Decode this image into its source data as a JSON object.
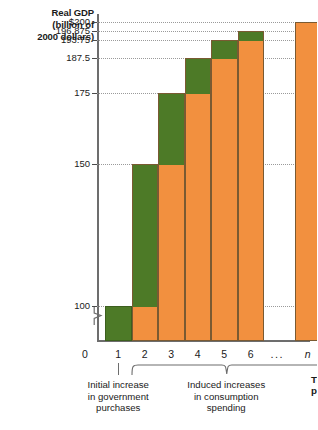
{
  "chart_data": {
    "type": "bar",
    "title": "",
    "ylabel": "Real GDP (billion of 2000 dollars)",
    "ylabel_lines": [
      "Real GDP",
      "(billion of",
      "2000 dollars)"
    ],
    "xlabel": "Time period",
    "xlabel_lines": [
      "Time",
      "period"
    ],
    "grid": true,
    "legend": "none",
    "axis_break": true,
    "ylim": [
      87.5,
      203
    ],
    "categories": [
      "1",
      "2",
      "3",
      "4",
      "5",
      "6",
      "...",
      "n"
    ],
    "yticks": [
      {
        "value": 200,
        "label": "$200"
      },
      {
        "value": 196.875,
        "label": "196.875"
      },
      {
        "value": 193.75,
        "label": "193.75"
      },
      {
        "value": 187.5,
        "label": "187.5"
      },
      {
        "value": 175,
        "label": "175"
      },
      {
        "value": 150,
        "label": "150"
      },
      {
        "value": 100,
        "label": "100"
      }
    ],
    "xtick_zero_label": "0",
    "series": [
      {
        "name": "Prior level (cumulative real GDP)",
        "color": "#f2903f",
        "values": [
          0,
          100,
          150,
          175,
          187.5,
          193.75,
          null,
          200
        ]
      },
      {
        "name": "New increase in real GDP",
        "color": "#4d7a27",
        "values": [
          100,
          50,
          25,
          12.5,
          6.25,
          3.125,
          null,
          0
        ]
      }
    ],
    "totals": [
      100,
      150,
      175,
      187.5,
      193.75,
      196.875,
      null,
      200
    ],
    "bars": [
      {
        "period": "1",
        "total": 100,
        "base": 0,
        "increment": 100
      },
      {
        "period": "2",
        "total": 150,
        "base": 100,
        "increment": 50
      },
      {
        "period": "3",
        "total": 175,
        "base": 150,
        "increment": 25
      },
      {
        "period": "4",
        "total": 187.5,
        "base": 175,
        "increment": 12.5
      },
      {
        "period": "5",
        "total": 193.75,
        "base": 187.5,
        "increment": 6.25
      },
      {
        "period": "6",
        "total": 196.875,
        "base": 193.75,
        "increment": 3.125
      },
      {
        "period": "n",
        "total": 200,
        "base": 200,
        "increment": 0
      }
    ],
    "annotations": [
      {
        "id": "initial",
        "lines": [
          "Initial increase",
          "in government",
          "purchases"
        ],
        "applies_to": [
          "1"
        ]
      },
      {
        "id": "induced",
        "lines": [
          "Induced increases",
          "in consumption",
          "spending"
        ],
        "applies_to": [
          "2",
          "3",
          "4",
          "5",
          "6",
          "...",
          "n"
        ]
      }
    ]
  },
  "colors": {
    "green": "#4d7a27",
    "orange": "#f2903f",
    "axis": "#6d6d6d",
    "grid": "#9a9a9a",
    "text": "#1a1a1a",
    "background": "#ffffff"
  }
}
